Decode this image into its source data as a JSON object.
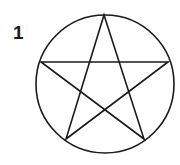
{
  "figure": {
    "label": "1",
    "shape": "pentagram-in-circle",
    "stroke_color": "#1a1a1a",
    "circle": {
      "cx": 105,
      "cy": 84,
      "r": 69
    },
    "star_points": [
      [
        104,
        15
      ],
      [
        144,
        139
      ],
      [
        41,
        62
      ],
      [
        168,
        62
      ],
      [
        66,
        139
      ]
    ]
  }
}
